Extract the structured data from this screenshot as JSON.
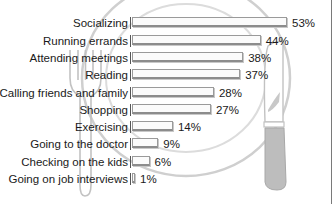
{
  "chart_data": {
    "type": "bar",
    "orientation": "horizontal",
    "title": "",
    "xlabel": "",
    "ylabel": "",
    "categories": [
      "Socializing",
      "Running errands",
      "Attending meetings",
      "Reading",
      "Calling friends and family",
      "Shopping",
      "Exercising",
      "Going to the doctor",
      "Checking on the kids",
      "Going on job interviews"
    ],
    "values": [
      53,
      44,
      38,
      37,
      28,
      27,
      14,
      9,
      6,
      1
    ],
    "value_labels": [
      "53%",
      "44%",
      "38%",
      "37%",
      "28%",
      "27%",
      "14%",
      "9%",
      "6%",
      "1%"
    ],
    "unit": "%",
    "xlim": [
      0,
      55
    ],
    "grid": false,
    "legend": "none",
    "background_illustration": "plate with fork and knife"
  },
  "colors": {
    "bar_fill": "#fbfbfb",
    "bar_border": "#9a9a9a",
    "illustration": "#c4c4c4",
    "knife_handle": "#bdbdbd",
    "text": "#1a1a1a"
  }
}
